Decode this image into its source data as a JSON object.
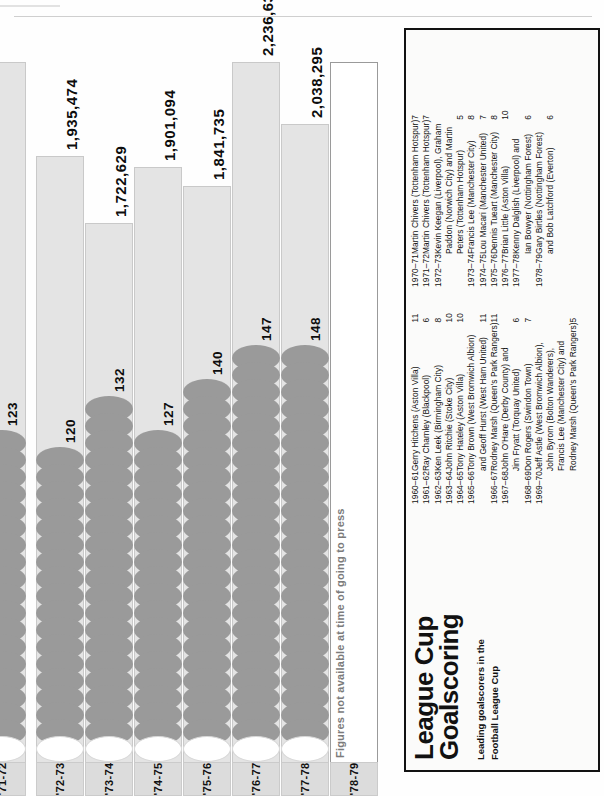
{
  "page": {
    "title": "League Cup Goalscoring",
    "title_line1": "League Cup",
    "title_line2": "Goalscoring",
    "subtitle_line1": "Leading goalscorers in the",
    "subtitle_line2": "Football League Cup",
    "note": "Figures not available at time of going to press"
  },
  "colors": {
    "attendance_bar": "#e4e4e4",
    "ball": "#9a9a9a",
    "panel_border": "#121212",
    "year_chip": "#dcdcdc",
    "text": "#0d0d0d"
  },
  "chart_data": {
    "type": "bar",
    "title": "League Cup Goalscoring",
    "xlabel": "",
    "ylabel": "",
    "categories": [
      "'71-72",
      "'72-73",
      "'73-74",
      "'74-75",
      "'75-76",
      "'76-77",
      "'77-78",
      "'78-79"
    ],
    "series": [
      {
        "name": "Aggregate attendance",
        "values": [
          null,
          1935474,
          1722629,
          1901094,
          1841735,
          2236636,
          2038295,
          null
        ],
        "labels": [
          "",
          "1,935,474",
          "1,722,629",
          "1,901,094",
          "1,841,735",
          "2,236,636",
          "2,038,295",
          ""
        ]
      },
      {
        "name": "Goals scored",
        "values": [
          123,
          120,
          132,
          127,
          140,
          147,
          148,
          null
        ],
        "labels": [
          "123",
          "120",
          "132",
          "127",
          "140",
          "147",
          "148",
          ""
        ]
      }
    ],
    "annotations": [
      "Figures not available at time of going to press"
    ],
    "ylim": [
      0,
      2400000
    ],
    "grid": false,
    "legend": "none"
  },
  "bars": [
    {
      "year": "'71-72",
      "attendance_label": "",
      "goals_label": "123",
      "goals": 123,
      "att_pct": 100,
      "goal_balls": 19,
      "clipped": true
    },
    {
      "year": "'72-73",
      "attendance_label": "1,935,474",
      "goals_label": "120",
      "goals": 120,
      "att_pct": 86.5,
      "goal_balls": 18,
      "clipped": false
    },
    {
      "year": "'73-74",
      "attendance_label": "1,722,629",
      "goals_label": "132",
      "goals": 132,
      "att_pct": 77.0,
      "goal_balls": 21,
      "clipped": false
    },
    {
      "year": "'74-75",
      "attendance_label": "1,901,094",
      "goals_label": "127",
      "goals": 127,
      "att_pct": 85.0,
      "goal_balls": 19,
      "clipped": false
    },
    {
      "year": "'75-76",
      "attendance_label": "1,841,735",
      "goals_label": "140",
      "goals": 140,
      "att_pct": 82.3,
      "goal_balls": 22,
      "clipped": false
    },
    {
      "year": "'76-77",
      "attendance_label": "2,236,636",
      "goals_label": "147",
      "goals": 147,
      "att_pct": 100,
      "goal_balls": 24,
      "clipped": false
    },
    {
      "year": "'77-78",
      "attendance_label": "2,038,295",
      "goals_label": "148",
      "goals": 148,
      "att_pct": 91.1,
      "goal_balls": 24,
      "clipped": false
    },
    {
      "year": "'78-79",
      "attendance_label": "",
      "goals_label": "",
      "goals": null,
      "att_pct": 0,
      "goal_balls": 0,
      "clipped": false
    }
  ],
  "list_left": [
    {
      "season": "1960–61",
      "scorer": "Gerry Hitchens (Aston Villa)",
      "goals": "11"
    },
    {
      "season": "1961–62",
      "scorer": "Ray Charnley (Blackpool)",
      "goals": "6"
    },
    {
      "season": "1962–63",
      "scorer": "Ken Leek (Birmingham City)",
      "goals": "8"
    },
    {
      "season": "1963–64",
      "scorer": "John Ritchie (Stoke City)",
      "goals": "10"
    },
    {
      "season": "1964–65",
      "scorer": "Tony Hateley (Aston Villa)",
      "goals": "10"
    },
    {
      "season": "1965–66",
      "scorer": "Tony Brown (West Bromwich Albion)",
      "goals": ""
    },
    {
      "season": "",
      "scorer": "and Geoff Hurst (West Ham United)",
      "goals": "11"
    },
    {
      "season": "1966–67",
      "scorer": "Rodney Marsh (Queen's Park Rangers)",
      "goals": "11"
    },
    {
      "season": "1967–68",
      "scorer": "John O'Hare (Derby County) and",
      "goals": ""
    },
    {
      "season": "",
      "scorer": "Jim Fryatt (Torquay United)",
      "goals": "6"
    },
    {
      "season": "1968–69",
      "scorer": "Don Rogers (Swindon Town)",
      "goals": "7"
    },
    {
      "season": "1969–70",
      "scorer": "Jeff Astle (West Bromwich Albion),",
      "goals": ""
    },
    {
      "season": "",
      "scorer": "John Byrom (Bolton Wanderers),",
      "goals": ""
    },
    {
      "season": "",
      "scorer": "Francis Lee (Manchester City) and",
      "goals": ""
    },
    {
      "season": "",
      "scorer": "Rodney Marsh (Queen's Park Rangers)",
      "goals": "5"
    }
  ],
  "list_right": [
    {
      "season": "1970–71",
      "scorer": "Martin Chivers (Tottenham Hotspur)",
      "goals": "7"
    },
    {
      "season": "1971–72",
      "scorer": "Martin Chivers (Tottenham Hotspur)",
      "goals": "7"
    },
    {
      "season": "1972–73",
      "scorer": "Kevin Keegan (Liverpool), Graham",
      "goals": ""
    },
    {
      "season": "",
      "scorer": "Paddon (Norwich City) and Martin",
      "goals": ""
    },
    {
      "season": "",
      "scorer": "Peters (Tottenham Hotspur)",
      "goals": "5"
    },
    {
      "season": "1973–74",
      "scorer": "Francis Lee (Manchester City)",
      "goals": "8"
    },
    {
      "season": "1974–75",
      "scorer": "Lou Macari (Manchester United)",
      "goals": "7"
    },
    {
      "season": "1975–76",
      "scorer": "Dennis Tueart (Manchester City)",
      "goals": "8"
    },
    {
      "season": "1976–77",
      "scorer": "Brian Little (Aston Villa)",
      "goals": "10"
    },
    {
      "season": "1977–78",
      "scorer": "Kenny Dalglish (Liverpool) and",
      "goals": ""
    },
    {
      "season": "",
      "scorer": "Ian Bowyer (Nottingham Forest)",
      "goals": "6"
    },
    {
      "season": "1978–79",
      "scorer": "Gary Birtles (Nottingham Forest)",
      "goals": ""
    },
    {
      "season": "",
      "scorer": "and Bob Latchford (Everton)",
      "goals": "6"
    }
  ]
}
